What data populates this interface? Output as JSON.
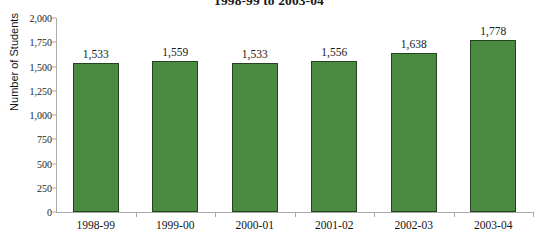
{
  "chart_data": {
    "type": "bar",
    "title": "1998-99 to 2003-04",
    "xlabel": "",
    "ylabel": "Number of Students",
    "categories": [
      "1998-99",
      "1999-00",
      "2000-01",
      "2001-02",
      "2002-03",
      "2003-04"
    ],
    "values": [
      1533,
      1559,
      1533,
      1556,
      1638,
      1778
    ],
    "value_labels": [
      "1,533",
      "1,559",
      "1,533",
      "1,556",
      "1,638",
      "1,778"
    ],
    "ylim": [
      0,
      2000
    ],
    "ytick_values": [
      2000,
      1750,
      1500,
      1250,
      1000,
      750,
      500,
      250,
      0
    ],
    "ytick_labels": [
      "2,000",
      "1,750",
      "1,500",
      "1,250",
      "1,000",
      "750",
      "500",
      "250",
      "0"
    ],
    "grid": false,
    "legend": null,
    "series": [
      {
        "name": "Number of Students",
        "values": [
          1533,
          1559,
          1533,
          1556,
          1638,
          1778
        ],
        "color": "#4b8b41",
        "border_color": "#24431f"
      }
    ]
  },
  "colors": {
    "bar_fill": "#4b8b41",
    "bar_border": "#24431f",
    "axis": "#a9a9a9",
    "text": "#1a1a1a",
    "background": "#ffffff"
  }
}
